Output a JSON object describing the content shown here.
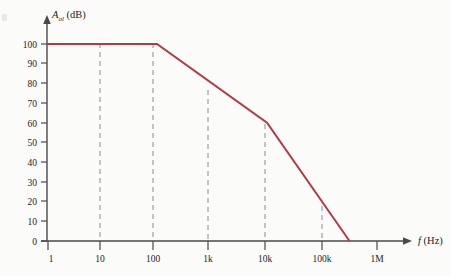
{
  "figure": {
    "background_color": "#fbfbfa",
    "axis_color": "#4a4a4a",
    "curve_color": "#b03a46",
    "grid_color": "#8c8c8c",
    "text_color": "#1d1d1d"
  },
  "labels": {
    "y_axis_symbol": "A",
    "y_axis_subscript": "ol",
    "y_axis_unit": " (dB)",
    "x_axis_symbol": "f",
    "x_axis_unit": " (Hz)"
  },
  "chart_data": {
    "type": "line",
    "title": "",
    "subtitle": "",
    "xlabel": "f (Hz)",
    "ylabel": "A_ol (dB)",
    "x_scale": "log",
    "y_scale": "linear",
    "xlim": [
      1,
      2000000
    ],
    "ylim": [
      0,
      100
    ],
    "grid": true,
    "grid_style": "dashed-vertical",
    "grid_x_values": [
      10,
      100,
      1000,
      10000,
      100000
    ],
    "legend": null,
    "x_tick_labels": [
      "1",
      "10",
      "100",
      "1k",
      "10k",
      "100k",
      "1M"
    ],
    "x_tick_values": [
      1,
      10,
      100,
      1000,
      10000,
      100000,
      1000000
    ],
    "y_tick_labels": [
      "0",
      "10",
      "20",
      "30",
      "40",
      "50",
      "60",
      "70",
      "80",
      "90",
      "100"
    ],
    "y_tick_values": [
      0,
      10,
      20,
      30,
      40,
      50,
      60,
      70,
      80,
      90,
      100
    ],
    "series": [
      {
        "name": "Open-loop gain",
        "color": "#b03a46",
        "points": [
          {
            "x": 1,
            "y": 100
          },
          {
            "x": 100,
            "y": 100
          },
          {
            "x": 10000,
            "y": 60
          },
          {
            "x": 316228,
            "y": 0
          }
        ],
        "segments": [
          {
            "from_x": 1,
            "to_x": 100,
            "slope_db_per_decade": 0,
            "description": "flat at 100 dB"
          },
          {
            "from_x": 100,
            "to_x": 10000,
            "slope_db_per_decade": -20,
            "description": "-20 dB/decade roll-off"
          },
          {
            "from_x": 10000,
            "to_x": 316228,
            "slope_db_per_decade": -40,
            "description": "-40 dB/decade roll-off to 0 dB"
          }
        ]
      }
    ],
    "annotations": []
  }
}
